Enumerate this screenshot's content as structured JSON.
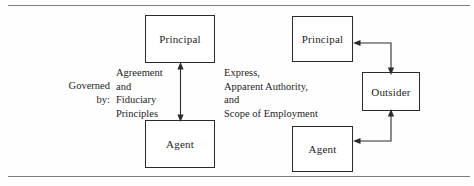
{
  "figure": {
    "nodes": {
      "principal_left": "Principal",
      "agent_left": "Agent",
      "principal_right": "Principal",
      "agent_right": "Agent",
      "outsider": "Outsider"
    },
    "labels": {
      "governed_by": "Governed\nby:",
      "left_basis": "Agreement\nand\nFiduciary\nPrinciples",
      "right_basis": "Express,\nApparent Authority,\nand\nScope of Employment"
    },
    "colors": {
      "border": "#2b2b2b",
      "rule": "#7d7d7d",
      "text": "#1d1d1d",
      "background": "#fefefe"
    }
  }
}
